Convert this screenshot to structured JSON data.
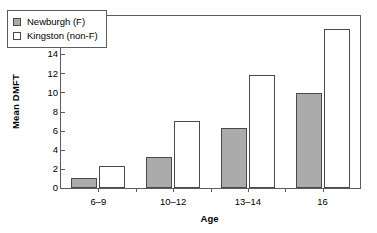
{
  "chart_data": {
    "type": "bar",
    "title": "",
    "xlabel": "Age",
    "ylabel": "Mean DMFT",
    "categories": [
      "6–9",
      "10–12",
      "13–14",
      "16"
    ],
    "series": [
      {
        "name": "Newburgh (F)",
        "values": [
          1.0,
          3.2,
          6.3,
          9.9
        ],
        "color": "#ababab"
      },
      {
        "name": "Kingston (non-F)",
        "values": [
          2.3,
          7.0,
          11.8,
          16.6
        ],
        "color": "#ffffff"
      }
    ],
    "ylim": [
      0,
      18
    ],
    "yticks": [
      0,
      2,
      4,
      6,
      8,
      10,
      12,
      14,
      16,
      18
    ],
    "ytick_labels": [
      "0",
      "2",
      "4",
      "6",
      "8",
      "10",
      "12",
      "14",
      "16",
      "18"
    ],
    "grid": false,
    "legend_position": "upper-left",
    "frame": true,
    "axis_color": "#5c5c5c",
    "bar_edge_color": "#4a4a4a"
  }
}
